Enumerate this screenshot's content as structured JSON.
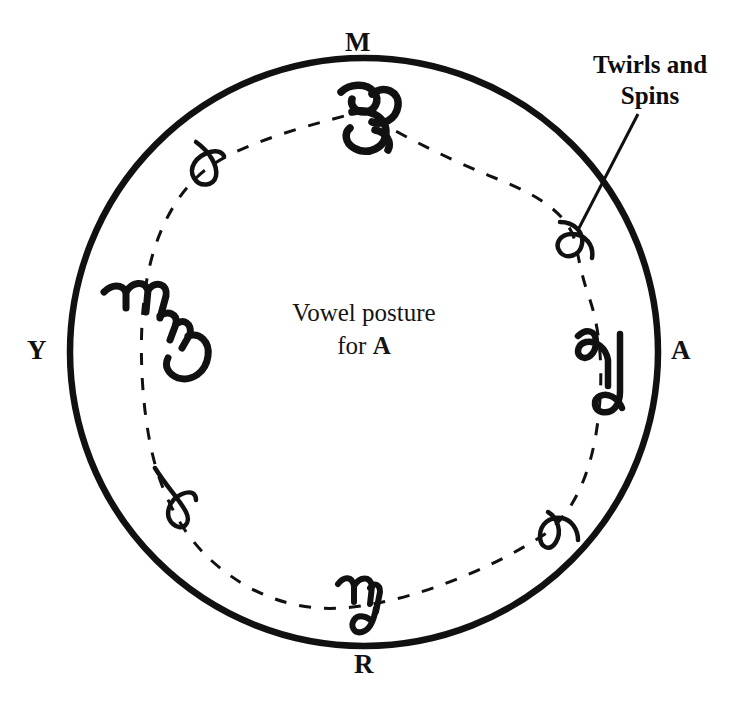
{
  "figure": {
    "type": "vowel-posture-circle-diagram",
    "background_color": "#ffffff",
    "ink_color": "#111111"
  },
  "center_caption": {
    "line1": "Vowel posture",
    "line2_prefix": "for ",
    "line2_vowel": "A"
  },
  "callout": {
    "line1": "Twirls and",
    "line2": "Spins",
    "target_glyph": "spiral-glyph-upper-right"
  },
  "cardinal_labels": [
    {
      "id": "m",
      "text": "M",
      "position": "top"
    },
    {
      "id": "a",
      "text": "A",
      "position": "right"
    },
    {
      "id": "r",
      "text": "R",
      "position": "bottom"
    },
    {
      "id": "y",
      "text": "Y",
      "position": "left"
    }
  ],
  "geometry": {
    "circle_center_x": 364,
    "circle_center_y": 352,
    "circle_radius": 294,
    "circle_stroke_width": 6
  },
  "glyphs": [
    {
      "id": "glyph-m-top",
      "name": "curl-glyph-top",
      "x": 368,
      "y": 110,
      "kind": "double-curl"
    },
    {
      "id": "glyph-upper-left-loop",
      "name": "loop-glyph-upper-left",
      "x": 208,
      "y": 160,
      "kind": "small-loop"
    },
    {
      "id": "glyph-y-left",
      "name": "squiggle-glyph-left",
      "x": 142,
      "y": 312,
      "kind": "multi-hump-curl"
    },
    {
      "id": "glyph-lower-left-loop",
      "name": "loop-glyph-lower-left",
      "x": 175,
      "y": 505,
      "kind": "small-loop"
    },
    {
      "id": "glyph-r-bottom",
      "name": "hook-glyph-bottom",
      "x": 358,
      "y": 600,
      "kind": "m-hook"
    },
    {
      "id": "glyph-lower-right-loop",
      "name": "loop-glyph-lower-right",
      "x": 548,
      "y": 530,
      "kind": "small-loop"
    },
    {
      "id": "glyph-a-right",
      "name": "curl-glyph-right",
      "x": 602,
      "y": 365,
      "kind": "wave-hook"
    },
    {
      "id": "glyph-spiral-upper-right",
      "name": "spiral-glyph-upper-right",
      "x": 572,
      "y": 236,
      "kind": "spiral-loop"
    }
  ],
  "paths": {
    "dashed_trajectory": "closed dashed loop passing through all eight glyph positions inside the circle",
    "callout_leader_line": "diagonal line from label down-left to spiral glyph"
  }
}
